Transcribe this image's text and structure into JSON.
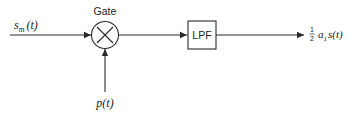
{
  "diagram": {
    "input_signal": {
      "base": "s",
      "sub": "m",
      "arg": "(t)"
    },
    "gate": {
      "label": "Gate",
      "symbol": "multiply"
    },
    "carrier": {
      "base": "p",
      "arg": "(t)"
    },
    "filter": {
      "label": "LPF"
    },
    "output": {
      "frac_num": "1",
      "frac_den": "2",
      "coef": "a",
      "coef_sub": "1",
      "signal": "s(t)"
    }
  }
}
